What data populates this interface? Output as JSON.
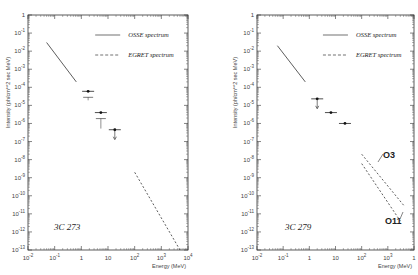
{
  "chart_data": [
    {
      "type": "line",
      "title": "3C 273",
      "xlabel": "Energy (MeV)",
      "ylabel": "Intensity (ph/cm**2 sec MeV)",
      "xscale": "log",
      "yscale": "log",
      "xlim": [
        0.01,
        10000
      ],
      "ylim": [
        1e-13,
        1
      ],
      "x_ticks": [
        "10^-2",
        "10^-1",
        "1",
        "10",
        "10^2",
        "10^3",
        "10^4"
      ],
      "y_ticks": [
        "1",
        "10^-1",
        "10^-2",
        "10^-3",
        "10^-4",
        "10^-5",
        "10^-6",
        "10^-7",
        "10^-8",
        "10^-9",
        "10^-10",
        "10^-11",
        "10^-12",
        "10^-13"
      ],
      "legend": [
        "OSSE spectrum",
        "EGRET spectrum"
      ],
      "legend_position": "upper right",
      "series": [
        {
          "name": "OSSE spectrum",
          "style": "solid",
          "x": [
            0.05,
            0.65
          ],
          "y": [
            0.03,
            0.0002
          ]
        },
        {
          "name": "EGRET spectrum",
          "style": "dashed",
          "x": [
            100,
            5000
          ],
          "y": [
            2e-09,
            1e-13
          ]
        },
        {
          "name": "data points",
          "style": "points",
          "x": [
            1.8,
            5.4,
            18
          ],
          "y": [
            6e-05,
            4e-06,
            4.5e-07
          ],
          "upper_limit_arrow": [
            false,
            false,
            true
          ]
        }
      ]
    },
    {
      "type": "line",
      "title": "3C 279",
      "xlabel": "Energy (MeV)",
      "ylabel": "Intensity (ph/cm**2 sec MeV)",
      "xscale": "log",
      "yscale": "log",
      "xlim": [
        0.01,
        10000
      ],
      "ylim": [
        1e-13,
        1
      ],
      "x_ticks": [
        "10^-2",
        "10^-1",
        "1",
        "10",
        "10^2",
        "10^3",
        "1"
      ],
      "y_ticks": [
        "1",
        "10^-1",
        "10^-2",
        "10^-3",
        "10^-4",
        "10^-5",
        "10^-6",
        "10^-7",
        "10^-8",
        "10^-9",
        "10^-10",
        "10^-11",
        "10^-12",
        "10^-13"
      ],
      "legend": [
        "OSSE spectrum",
        "EGRET spectrum"
      ],
      "legend_position": "upper right",
      "annotations": [
        "O3",
        "O11"
      ],
      "series": [
        {
          "name": "OSSE spectrum",
          "style": "solid",
          "x": [
            0.06,
            0.7
          ],
          "y": [
            0.02,
            0.0002
          ]
        },
        {
          "name": "EGRET spectrum O3",
          "style": "dashed",
          "x": [
            100,
            4000
          ],
          "y": [
            2e-08,
            3e-11
          ]
        },
        {
          "name": "EGRET spectrum O11",
          "style": "dashed",
          "x": [
            100,
            3000
          ],
          "y": [
            6e-09,
            4e-12
          ]
        },
        {
          "name": "data points",
          "style": "points",
          "x": [
            2,
            6.7,
            23
          ],
          "y": [
            2.3e-05,
            4e-06,
            1e-06
          ],
          "upper_limit_arrow": [
            true,
            false,
            false
          ]
        }
      ]
    }
  ],
  "panels": [
    {
      "source_label": "3C 273",
      "legend_osse": "OSSE spectrum",
      "legend_egret": "EGRET spectrum",
      "ylabel": "Intensity (ph/cm**2 sec MeV)",
      "xlabel": "Energy (MeV)"
    },
    {
      "source_label": "3C 279",
      "legend_osse": "OSSE spectrum",
      "legend_egret": "EGRET spectrum",
      "ylabel": "Intensity (ph/cm**2 sec MeV)",
      "xlabel": "Energy (MeV)",
      "annotation_upper": "O3",
      "annotation_lower": "O11"
    }
  ]
}
